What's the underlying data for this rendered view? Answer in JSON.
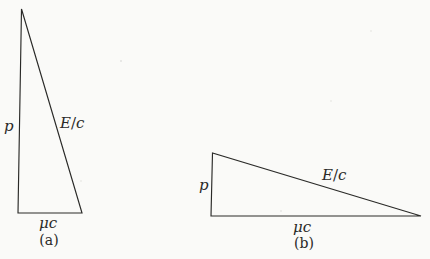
{
  "figure": {
    "colors": {
      "paper": "#fafaf8",
      "ink": "#2a2a28"
    },
    "diagrams": [
      {
        "id": "a",
        "caption": "(a)",
        "labels": {
          "vertical_side": "p",
          "hypotenuse_numerator": "E",
          "hypotenuse_slash": "/",
          "hypotenuse_denominator": "c",
          "base": "μc"
        }
      },
      {
        "id": "b",
        "caption": "(b)",
        "labels": {
          "vertical_side": "p",
          "hypotenuse_numerator": "E",
          "hypotenuse_slash": "/",
          "hypotenuse_denominator": "c",
          "base": "μc"
        }
      }
    ]
  }
}
